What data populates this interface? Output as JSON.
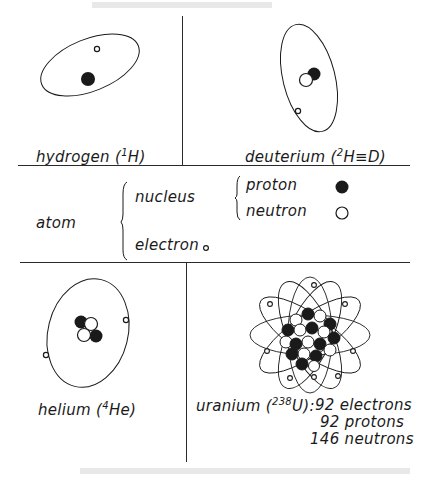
{
  "panels": {
    "hydrogen": {
      "name": "hydrogen",
      "symbol_pre": "(",
      "mass": "1",
      "symbol": "H)"
    },
    "deuterium": {
      "name": "deuterium",
      "symbol_pre": "(",
      "mass": "2",
      "symbol": "H≡D)"
    },
    "helium": {
      "name": "helium",
      "symbol_pre": "(",
      "mass": "4",
      "symbol": "He)"
    },
    "uranium": {
      "name": "uranium",
      "symbol_pre": "(",
      "mass": "238",
      "symbol": "U):",
      "electrons": "92 electrons",
      "protons": "92 protons",
      "neutrons": "146 neutrons"
    }
  },
  "legend": {
    "atom": "atom",
    "nucleus": "nucleus",
    "electron": "electron",
    "proton": "proton",
    "neutron": "neutron"
  },
  "colors": {
    "ink": "#1a1a1a",
    "paper": "#ffffff"
  }
}
